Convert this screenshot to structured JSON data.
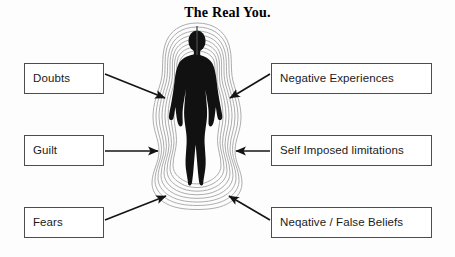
{
  "diagram": {
    "title": "The Real You.",
    "center_figure": {
      "name": "human-silhouette",
      "description": "black female silhouette with concentric wavy aura rings",
      "aura_rings": 8,
      "silhouette_color": "#111111",
      "aura_color": "#9a9a9a"
    },
    "background_color": "#fdfdfd",
    "box_border_color": "#4d4d4d",
    "box_fill_color": "#ffffff",
    "arrow_color": "#141414",
    "left_labels": [
      {
        "id": "doubts",
        "text": "Doubts"
      },
      {
        "id": "guilt",
        "text": "Guilt"
      },
      {
        "id": "fears",
        "text": "Fears"
      }
    ],
    "right_labels": [
      {
        "id": "negative-experiences",
        "text": "Negative Experiences"
      },
      {
        "id": "self-imposed-limitations",
        "text": "Self Imposed limitations"
      },
      {
        "id": "negative-false-beliefs",
        "text": "Neqative / False Beliefs"
      }
    ]
  }
}
